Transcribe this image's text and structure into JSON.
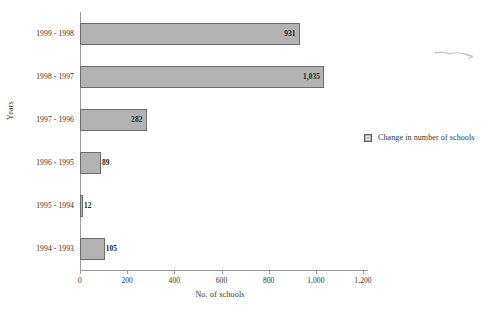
{
  "chart_data": {
    "type": "bar",
    "orientation": "horizontal",
    "title": "",
    "xlabel": "No. of schools",
    "ylabel": "Years",
    "categories": [
      "1999 - 1998",
      "1998 - 1997",
      "1997 - 1996",
      "1996 - 1995",
      "1995 - 1994",
      "1994 - 1993"
    ],
    "values": [
      931,
      1035,
      282,
      89,
      12,
      105
    ],
    "value_labels": [
      "931",
      "1,035",
      "282",
      "89",
      "12",
      "105"
    ],
    "series": [
      {
        "name": "Change in number of schools",
        "values": [
          931,
          1035,
          282,
          89,
          12,
          105
        ]
      }
    ],
    "xlim": [
      0,
      1200
    ],
    "xticks": [
      0,
      200,
      400,
      600,
      800,
      1000,
      1200
    ],
    "xtick_labels": [
      "0",
      "200",
      "400",
      "600",
      "800",
      "1,000",
      "1,200"
    ],
    "grid": false,
    "legend": {
      "position": "right",
      "entries": [
        "Change in number of schools"
      ]
    },
    "colors": {
      "bar_fill": "#b3b3b3",
      "bar_border": "#6d6d6d",
      "axis": "#9a9a9a",
      "text": "#33312f",
      "background": "#ffffff"
    }
  },
  "axes": {
    "x_title": "No. of schools",
    "y_title": "Years"
  },
  "legend": {
    "label": "Change in number of schools"
  },
  "ticks": {
    "x": [
      "0",
      "200",
      "400",
      "600",
      "800",
      "1,000",
      "1,200"
    ]
  },
  "bars": [
    {
      "category": "1999 - 1998",
      "value": 931,
      "label": "931"
    },
    {
      "category": "1998 - 1997",
      "value": 1035,
      "label": "1,035"
    },
    {
      "category": "1997 - 1996",
      "value": 282,
      "label": "282"
    },
    {
      "category": "1996 - 1995",
      "value": 89,
      "label": "89"
    },
    {
      "category": "1995 - 1994",
      "value": 12,
      "label": "12"
    },
    {
      "category": "1994 - 1993",
      "value": 105,
      "label": "105"
    }
  ]
}
